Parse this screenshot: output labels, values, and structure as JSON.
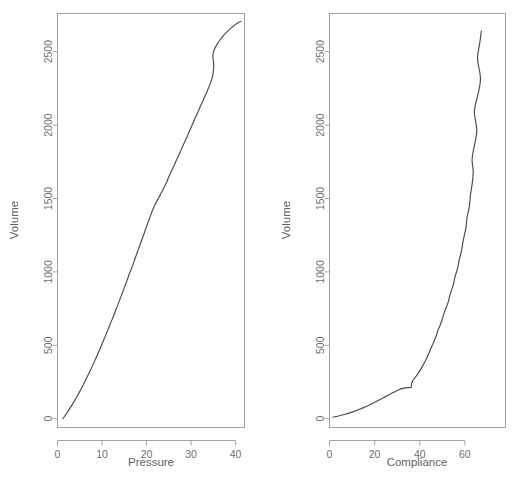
{
  "figure": {
    "background": "#ffffff",
    "line_color": "#4a4a4a",
    "axis_color": "#9a9a9a",
    "text_color": "#6b6b6b"
  },
  "chart_data": [
    {
      "type": "line",
      "panel": "left",
      "title": "",
      "xlabel": "Pressure",
      "ylabel": "Volume",
      "xlim": [
        0,
        42
      ],
      "ylim": [
        -60,
        2760
      ],
      "xticks": [
        0,
        10,
        20,
        30,
        40
      ],
      "xticklabels": [
        "0",
        "10",
        "20",
        "30",
        "40"
      ],
      "yticks": [
        0,
        500,
        1000,
        1500,
        2000,
        2500
      ],
      "yticklabels": [
        "0",
        "500",
        "1000",
        "1500",
        "2000",
        "2500"
      ],
      "grid": false,
      "legend": "none",
      "x": [
        1.2,
        1.9,
        2.6,
        3.3,
        4.0,
        4.8,
        5.6,
        6.4,
        7.2,
        8.0,
        8.8,
        9.6,
        10.4,
        11.2,
        12.0,
        12.8,
        13.5,
        14.2,
        14.9,
        15.6,
        16.2,
        16.9,
        17.5,
        18.1,
        18.7,
        19.3,
        19.8,
        20.3,
        20.8,
        21.3,
        21.8,
        22.3,
        22.8,
        23.2,
        23.7,
        24.1,
        24.6,
        25.0,
        25.4,
        25.8,
        26.3,
        26.7,
        27.1,
        27.5,
        27.9,
        28.3,
        28.8,
        29.2,
        29.6,
        30.0,
        30.4,
        30.8,
        31.3,
        31.7,
        32.1,
        32.6,
        33.0,
        33.4,
        33.8,
        34.2,
        34.5,
        34.8,
        35.0,
        35.1,
        35.0,
        34.9,
        35.0,
        35.3,
        35.8,
        36.4,
        37.1,
        37.8,
        38.5,
        39.1,
        39.6,
        40.0,
        40.4,
        40.7,
        41.0,
        41.2
      ],
      "y": [
        0,
        30,
        62,
        96,
        132,
        174,
        220,
        268,
        318,
        370,
        424,
        480,
        538,
        596,
        656,
        716,
        772,
        828,
        884,
        940,
        992,
        1046,
        1098,
        1148,
        1198,
        1248,
        1292,
        1334,
        1376,
        1416,
        1452,
        1482,
        1508,
        1532,
        1560,
        1586,
        1618,
        1648,
        1674,
        1700,
        1732,
        1760,
        1786,
        1812,
        1840,
        1868,
        1900,
        1928,
        1956,
        1984,
        2012,
        2040,
        2072,
        2100,
        2128,
        2160,
        2188,
        2216,
        2244,
        2272,
        2300,
        2330,
        2364,
        2400,
        2436,
        2466,
        2494,
        2520,
        2548,
        2576,
        2604,
        2628,
        2648,
        2664,
        2676,
        2686,
        2694,
        2700,
        2704,
        2706
      ]
    },
    {
      "type": "line",
      "panel": "right",
      "title": "",
      "xlabel": "Compliance",
      "ylabel": "Volume",
      "xlim": [
        0,
        78
      ],
      "ylim": [
        -60,
        2760
      ],
      "xticks": [
        0,
        20,
        40,
        60
      ],
      "xticklabels": [
        "0",
        "20",
        "40",
        "60"
      ],
      "yticks": [
        0,
        500,
        1000,
        1500,
        2000,
        2500
      ],
      "yticklabels": [
        "0",
        "500",
        "1000",
        "1500",
        "2000",
        "2500"
      ],
      "grid": false,
      "legend": "none",
      "x": [
        1.5,
        4.0,
        7.0,
        10.0,
        13.0,
        16.0,
        19.0,
        22.0,
        25.0,
        28.0,
        30.5,
        33.0,
        35.0,
        36.2,
        36.4,
        37.0,
        38.5,
        40.0,
        41.2,
        42.4,
        43.4,
        44.2,
        44.9,
        45.8,
        46.6,
        47.4,
        47.9,
        48.8,
        49.6,
        50.2,
        50.7,
        51.5,
        52.3,
        52.9,
        53.3,
        54.0,
        54.7,
        55.2,
        55.6,
        56.2,
        56.8,
        57.2,
        57.6,
        58.2,
        58.7,
        59.0,
        59.4,
        59.9,
        60.4,
        60.7,
        60.9,
        61.4,
        61.9,
        62.2,
        62.4,
        62.8,
        63.2,
        63.5,
        63.7,
        63.5,
        63.2,
        63.4,
        63.9,
        64.5,
        65.0,
        65.3,
        65.0,
        64.5,
        64.2,
        64.6,
        65.3,
        66.0,
        66.6,
        66.9,
        66.6,
        66.0,
        65.6,
        65.9,
        66.6,
        67.3
      ],
      "y": [
        10,
        18,
        30,
        45,
        62,
        82,
        104,
        128,
        152,
        176,
        196,
        208,
        212,
        214,
        240,
        262,
        292,
        326,
        358,
        392,
        424,
        452,
        478,
        508,
        538,
        568,
        596,
        628,
        660,
        688,
        716,
        748,
        780,
        810,
        840,
        872,
        904,
        934,
        964,
        996,
        1028,
        1058,
        1090,
        1124,
        1158,
        1190,
        1224,
        1258,
        1294,
        1330,
        1366,
        1402,
        1440,
        1478,
        1516,
        1556,
        1596,
        1636,
        1676,
        1716,
        1756,
        1796,
        1838,
        1880,
        1922,
        1964,
        2006,
        2048,
        2090,
        2134,
        2178,
        2222,
        2268,
        2314,
        2360,
        2406,
        2452,
        2500,
        2560,
        2640
      ]
    }
  ]
}
